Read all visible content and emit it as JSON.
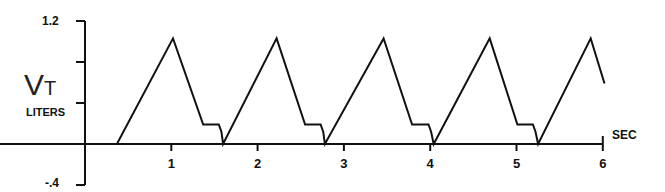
{
  "chart_data": {
    "type": "line",
    "title": "",
    "ylabel": "VT",
    "ylabel_unit": "LITERS",
    "xlabel": "SEC",
    "xlim": [
      0,
      6
    ],
    "ylim": [
      -0.4,
      1.2
    ],
    "grid": false,
    "legend": null,
    "yticks": [
      -0.4,
      0,
      0.4,
      0.8,
      1.2
    ],
    "ytick_labels": [
      "-.4",
      "",
      "",
      "",
      "1.2"
    ],
    "xticks": [
      1,
      2,
      3,
      4,
      5,
      6
    ],
    "xtick_labels": [
      "1",
      "2",
      "3",
      "4",
      "5",
      "6"
    ],
    "series": [
      {
        "name": "Tidal volume",
        "x": [
          0,
          0.37,
          1.02,
          1.37,
          1.55,
          1.58,
          1.6,
          2.22,
          2.55,
          2.73,
          2.76,
          2.78,
          3.46,
          3.79,
          3.98,
          4.01,
          4.04,
          4.69,
          5.01,
          5.19,
          5.22,
          5.25,
          5.86,
          6.02
        ],
        "y": [
          0,
          0,
          1.03,
          0.19,
          0.19,
          0.12,
          0,
          1.03,
          0.19,
          0.19,
          0.12,
          0,
          1.03,
          0.19,
          0.19,
          0.12,
          0,
          1.03,
          0.19,
          0.19,
          0.12,
          0,
          1.03,
          0.59
        ]
      }
    ]
  },
  "labels": {
    "y_main": "V",
    "y_sub": "T",
    "y_unit": "LITERS",
    "x_unit": "SEC",
    "y_top": "1.2",
    "y_bottom": "-.4"
  }
}
